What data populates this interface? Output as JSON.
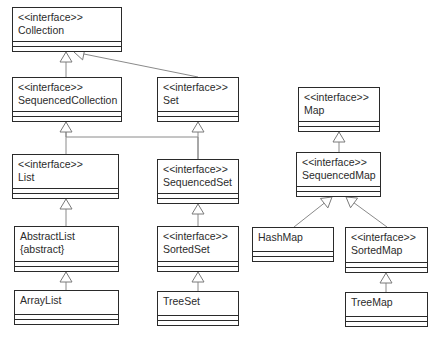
{
  "diagram": {
    "type": "UML class diagram",
    "classes": [
      {
        "id": "collection",
        "stereotype": "<<interface>>",
        "name": "Collection",
        "modifier": "",
        "x": 12,
        "y": 7,
        "w": 110,
        "h": 45
      },
      {
        "id": "sequencedcollection",
        "stereotype": "<<interface>>",
        "name": "SequencedCollection",
        "modifier": "",
        "x": 12,
        "y": 77,
        "w": 110,
        "h": 45
      },
      {
        "id": "set",
        "stereotype": "<<interface>>",
        "name": "Set",
        "modifier": "",
        "x": 157,
        "y": 77,
        "w": 82,
        "h": 45
      },
      {
        "id": "list",
        "stereotype": "<<interface>>",
        "name": "List",
        "modifier": "",
        "x": 12,
        "y": 154,
        "w": 107,
        "h": 45
      },
      {
        "id": "sequencedset",
        "stereotype": "<<interface>>",
        "name": "SequencedSet",
        "modifier": "",
        "x": 157,
        "y": 159,
        "w": 82,
        "h": 45
      },
      {
        "id": "abstractlist",
        "stereotype": "",
        "name": "AbstractList",
        "modifier": "{abstract}",
        "x": 14,
        "y": 226,
        "w": 105,
        "h": 46
      },
      {
        "id": "sortedset",
        "stereotype": "<<interface>>",
        "name": "SortedSet",
        "modifier": "",
        "x": 157,
        "y": 226,
        "w": 82,
        "h": 46
      },
      {
        "id": "arraylist",
        "stereotype": "",
        "name": "ArrayList",
        "modifier": "",
        "x": 14,
        "y": 290,
        "w": 105,
        "h": 35
      },
      {
        "id": "treeset",
        "stereotype": "",
        "name": "TreeSet",
        "modifier": "",
        "x": 157,
        "y": 291,
        "w": 82,
        "h": 35
      },
      {
        "id": "map",
        "stereotype": "<<interface>>",
        "name": "Map",
        "modifier": "",
        "x": 298,
        "y": 87,
        "w": 82,
        "h": 45
      },
      {
        "id": "sequencedmap",
        "stereotype": "<<interface>>",
        "name": "SequencedMap",
        "modifier": "",
        "x": 296,
        "y": 152,
        "w": 85,
        "h": 45
      },
      {
        "id": "hashmap",
        "stereotype": "",
        "name": "HashMap",
        "modifier": "",
        "x": 252,
        "y": 227,
        "w": 82,
        "h": 35
      },
      {
        "id": "sortedmap",
        "stereotype": "<<interface>>",
        "name": "SortedMap",
        "modifier": "",
        "x": 345,
        "y": 227,
        "w": 83,
        "h": 46
      },
      {
        "id": "treemap",
        "stereotype": "",
        "name": "TreeMap",
        "modifier": "",
        "x": 345,
        "y": 292,
        "w": 83,
        "h": 35
      }
    ],
    "generalizations": [
      {
        "from": "sequencedcollection",
        "to": "collection",
        "points": [
          [
            66,
            77
          ],
          [
            66,
            52
          ]
        ]
      },
      {
        "from": "set",
        "to": "collection",
        "points": [
          [
            198,
            77
          ],
          [
            74,
            52
          ]
        ]
      },
      {
        "from": "list",
        "to": "sequencedcollection",
        "points": [
          [
            66,
            154
          ],
          [
            66,
            137
          ],
          [
            66,
            122
          ]
        ]
      },
      {
        "from": "sequencedset",
        "to": "sequencedcollection",
        "points": [
          [
            198,
            159
          ],
          [
            198,
            137
          ],
          [
            66,
            137
          ],
          [
            66,
            122
          ]
        ]
      },
      {
        "from": "sequencedset",
        "to": "set",
        "points": [
          [
            198,
            159
          ],
          [
            198,
            122
          ]
        ]
      },
      {
        "from": "abstractlist",
        "to": "list",
        "points": [
          [
            66,
            226
          ],
          [
            66,
            199
          ]
        ]
      },
      {
        "from": "arraylist",
        "to": "abstractlist",
        "points": [
          [
            66,
            290
          ],
          [
            66,
            272
          ]
        ]
      },
      {
        "from": "sortedset",
        "to": "sequencedset",
        "points": [
          [
            198,
            226
          ],
          [
            198,
            204
          ]
        ]
      },
      {
        "from": "treeset",
        "to": "sortedset",
        "points": [
          [
            198,
            291
          ],
          [
            198,
            272
          ]
        ]
      },
      {
        "from": "sequencedmap",
        "to": "map",
        "points": [
          [
            339,
            152
          ],
          [
            339,
            132
          ]
        ]
      },
      {
        "from": "hashmap",
        "to": "sequencedmap",
        "points": [
          [
            294,
            227
          ],
          [
            332,
            197
          ]
        ]
      },
      {
        "from": "sortedmap",
        "to": "sequencedmap",
        "points": [
          [
            387,
            227
          ],
          [
            346,
            197
          ]
        ]
      },
      {
        "from": "treemap",
        "to": "sortedmap",
        "points": [
          [
            386,
            292
          ],
          [
            386,
            273
          ]
        ]
      }
    ],
    "colors": {
      "box_border": "#2a2a2a",
      "connector": "#8a8a8a",
      "text": "#2b2b2b",
      "background": "#ffffff"
    }
  }
}
